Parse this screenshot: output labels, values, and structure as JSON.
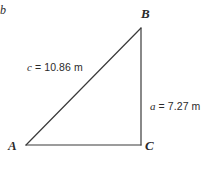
{
  "figure": {
    "type": "right-triangle-diagram",
    "background_color": "#ffffff",
    "stroke_color": "#3a3a3a",
    "text_color": "#2b2b2b"
  },
  "vertices": {
    "A": {
      "label": "A",
      "x": 26,
      "y": 145
    },
    "B": {
      "label": "B",
      "x": 141,
      "y": 28
    },
    "C": {
      "label": "C",
      "x": 141,
      "y": 145
    }
  },
  "sides": {
    "c": {
      "variable": "c",
      "equals": "=",
      "value": "10.86",
      "unit": "m",
      "full_text": "c = 10.86 m",
      "from": "A",
      "to": "B"
    },
    "a": {
      "variable": "a",
      "equals": "=",
      "value": "7.27",
      "unit": "m",
      "full_text": "a = 7.27 m",
      "from": "B",
      "to": "C"
    },
    "b": {
      "variable": "b",
      "full_text": "b",
      "from": "A",
      "to": "C"
    }
  }
}
